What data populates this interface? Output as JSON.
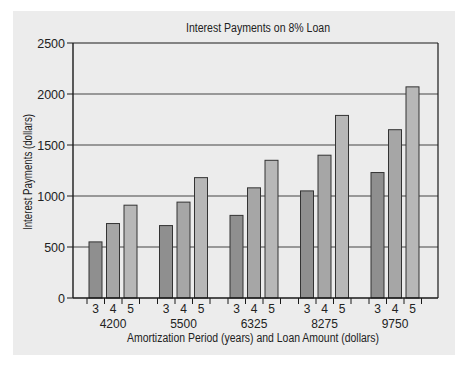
{
  "chart_data": {
    "type": "bar",
    "title": "Interest Payments on 8% Loan",
    "xlabel": "Amortization Period (years) and Loan Amount (dollars)",
    "ylabel": "Interest Payments (dollars)",
    "ylim": [
      0,
      2500
    ],
    "yticks": [
      0,
      500,
      1000,
      1500,
      2000,
      2500
    ],
    "grid": true,
    "legend": null,
    "categories": [
      "4200",
      "5500",
      "6325",
      "8275",
      "9750"
    ],
    "sub_categories": [
      "3",
      "4",
      "5"
    ],
    "series": [
      {
        "name": "3",
        "values": [
          550,
          710,
          810,
          1050,
          1230
        ],
        "color": "#8f8f8f"
      },
      {
        "name": "4",
        "values": [
          730,
          940,
          1080,
          1400,
          1650
        ],
        "color": "#a6a6a6"
      },
      {
        "name": "5",
        "values": [
          910,
          1180,
          1350,
          1790,
          2070
        ],
        "color": "#b7b7b7"
      }
    ]
  },
  "colors": {
    "panel_background": "#ececec",
    "axis": "#1a1a1a",
    "gridline": "#444444",
    "bar_stroke": "#333333"
  }
}
